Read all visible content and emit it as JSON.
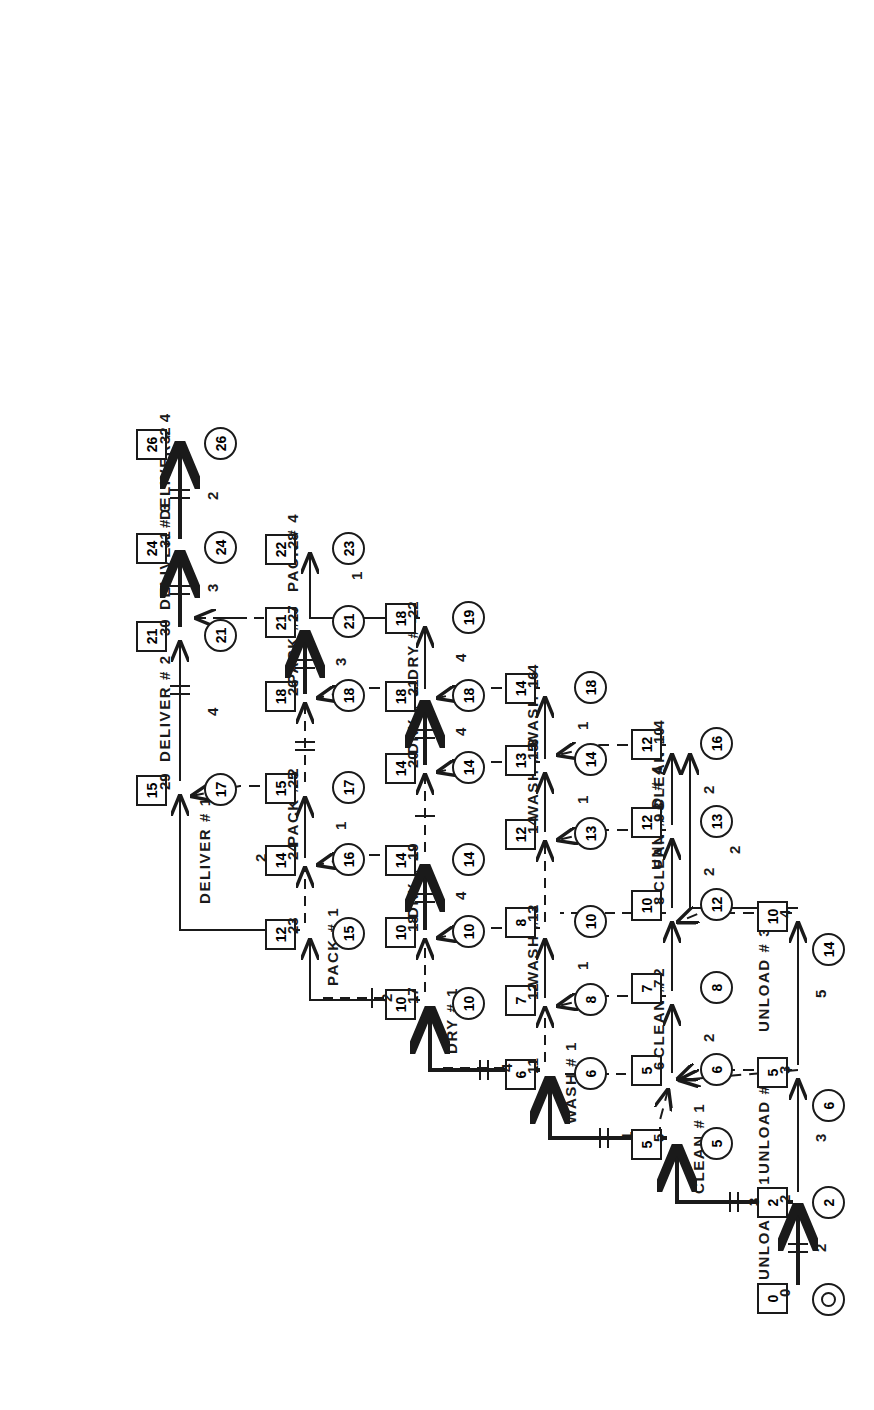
{
  "diagram": {
    "type": "activity-on-arrow network",
    "orientation": "rotated-90",
    "legend": {
      "square_meaning": "earliest event time",
      "circle_meaning": "latest event time",
      "solid_arrow": "real activity",
      "dashed_arrow": "dummy activity",
      "heavy_arrow": "critical path"
    },
    "colors": {
      "ink": "#1a1a1a",
      "paper": "#ffffff"
    },
    "nodes": [
      {
        "id": "0",
        "es": "0",
        "lf": "0"
      },
      {
        "id": "2",
        "es": "2",
        "lf": "2"
      },
      {
        "id": "3",
        "es": "5",
        "lf": "6"
      },
      {
        "id": "4",
        "es": "10",
        "lf": "14"
      },
      {
        "id": "5",
        "es": "5",
        "lf": "5"
      },
      {
        "id": "6",
        "es": "5",
        "lf": "6"
      },
      {
        "id": "7",
        "es": "7",
        "lf": "8"
      },
      {
        "id": "8",
        "es": "10",
        "lf": "12"
      },
      {
        "id": "9",
        "es": "12",
        "lf": "13"
      },
      {
        "id": "10",
        "es": "12",
        "lf": "16"
      },
      {
        "id": "11",
        "es": "6",
        "lf": "6"
      },
      {
        "id": "12",
        "es": "7",
        "lf": "8"
      },
      {
        "id": "13",
        "es": "8",
        "lf": "10"
      },
      {
        "id": "14",
        "es": "12",
        "lf": "13"
      },
      {
        "id": "15",
        "es": "13",
        "lf": "14"
      },
      {
        "id": "16",
        "es": "14",
        "lf": "18"
      },
      {
        "id": "17",
        "es": "10",
        "lf": "10"
      },
      {
        "id": "18",
        "es": "10",
        "lf": "10"
      },
      {
        "id": "19",
        "es": "14",
        "lf": "14"
      },
      {
        "id": "20",
        "es": "14",
        "lf": "14"
      },
      {
        "id": "21",
        "es": "18",
        "lf": "18"
      },
      {
        "id": "22",
        "es": "18",
        "lf": "19"
      },
      {
        "id": "23",
        "es": "12",
        "lf": "15"
      },
      {
        "id": "24",
        "es": "14",
        "lf": "16"
      },
      {
        "id": "25",
        "es": "15",
        "lf": "17"
      },
      {
        "id": "26",
        "es": "18",
        "lf": "18"
      },
      {
        "id": "27",
        "es": "21",
        "lf": "21"
      },
      {
        "id": "28",
        "es": "22",
        "lf": "23"
      },
      {
        "id": "29",
        "es": "15",
        "lf": "17"
      },
      {
        "id": "30",
        "es": "21",
        "lf": "21"
      },
      {
        "id": "31",
        "es": "24",
        "lf": "24"
      },
      {
        "id": "32",
        "es": "26",
        "lf": "26"
      }
    ],
    "activities": [
      {
        "name": "UNLOAD # 1",
        "duration": "2",
        "from": "0",
        "to": "2",
        "critical": true
      },
      {
        "name": "UNLOAD # 2",
        "duration": "3",
        "from": "2",
        "to": "3",
        "critical": false
      },
      {
        "name": "UNLOAD # 3",
        "duration": "5",
        "from": "3",
        "to": "4",
        "critical": false
      },
      {
        "name": "UNLOAD # 4",
        "duration": "2",
        "from": "4",
        "to": "10",
        "critical": false
      },
      {
        "name": "CLEAN # 1",
        "duration": "3",
        "from": "2",
        "to": "5",
        "critical": true
      },
      {
        "name": "CLEAN # 2",
        "duration": "2",
        "from": "6",
        "to": "7",
        "critical": false
      },
      {
        "name": "CLEAN # 3",
        "duration": "2",
        "from": "8",
        "to": "9",
        "critical": false
      },
      {
        "name": "CLEAN # 4",
        "duration": "2",
        "from": "9",
        "to": "10",
        "critical": false
      },
      {
        "name": "WASH # 1",
        "duration": "1",
        "from": "5",
        "to": "11",
        "critical": true
      },
      {
        "name": "WASH # 2",
        "duration": "1",
        "from": "12",
        "to": "13",
        "critical": false
      },
      {
        "name": "WASH # 3",
        "duration": "1",
        "from": "14",
        "to": "15",
        "critical": false
      },
      {
        "name": "WASH # 4",
        "duration": "1",
        "from": "15",
        "to": "16",
        "critical": false
      },
      {
        "name": "DRY # 1",
        "duration": "4",
        "from": "11",
        "to": "17",
        "critical": true
      },
      {
        "name": "DRY # 2",
        "duration": "4",
        "from": "18",
        "to": "19",
        "critical": true
      },
      {
        "name": "DRY # 3",
        "duration": "4",
        "from": "20",
        "to": "21",
        "critical": true
      },
      {
        "name": "DRY # 4",
        "duration": "4",
        "from": "21",
        "to": "22",
        "critical": false
      },
      {
        "name": "PACK # 1",
        "duration": "2",
        "from": "17",
        "to": "23",
        "critical": false
      },
      {
        "name": "PACK # 2",
        "duration": "1",
        "from": "24",
        "to": "25",
        "critical": false
      },
      {
        "name": "PACK # 3",
        "duration": "3",
        "from": "26",
        "to": "27",
        "critical": true
      },
      {
        "name": "PACK # 4",
        "duration": "1",
        "from": "22",
        "to": "28",
        "critical": false
      },
      {
        "name": "DELIVER # 1",
        "duration": "2",
        "from": "23",
        "to": "29",
        "critical": false
      },
      {
        "name": "DELIVER # 2",
        "duration": "4",
        "from": "29",
        "to": "30",
        "critical": false
      },
      {
        "name": "DELIVER # 3",
        "duration": "3",
        "from": "30",
        "to": "31",
        "critical": true
      },
      {
        "name": "DELIVER # 4",
        "duration": "2",
        "from": "31",
        "to": "32",
        "critical": true
      }
    ],
    "dummies": [
      {
        "from": "3",
        "to": "6"
      },
      {
        "from": "4",
        "to": "8"
      },
      {
        "from": "5",
        "to": "6"
      },
      {
        "from": "6",
        "to": "8"
      },
      {
        "from": "7",
        "to": "12"
      },
      {
        "from": "8",
        "to": "10"
      },
      {
        "from": "9",
        "to": "14"
      },
      {
        "from": "10",
        "to": "16"
      },
      {
        "from": "11",
        "to": "12"
      },
      {
        "from": "13",
        "to": "14"
      },
      {
        "from": "13",
        "to": "18"
      },
      {
        "from": "15",
        "to": "20"
      },
      {
        "from": "16",
        "to": "22"
      },
      {
        "from": "17",
        "to": "18"
      },
      {
        "from": "19",
        "to": "20"
      },
      {
        "from": "19",
        "to": "24"
      },
      {
        "from": "21",
        "to": "26"
      },
      {
        "from": "23",
        "to": "24"
      },
      {
        "from": "25",
        "to": "26"
      },
      {
        "from": "25",
        "to": "29"
      },
      {
        "from": "26",
        "to": "28"
      },
      {
        "from": "27",
        "to": "30"
      }
    ],
    "node_labels": {
      "n0": "0",
      "n2": "2",
      "n3": "3",
      "n4": "4",
      "n5": "5",
      "n6": "6",
      "n7": "7",
      "n8": "8",
      "n9": "9",
      "n10": "10",
      "n11": "11",
      "n12": "12",
      "n13": "13",
      "n14": "14",
      "n15": "15",
      "n16": "16",
      "n17": "17",
      "n18": "18",
      "n19": "19",
      "n20": "20",
      "n21": "21",
      "n22": "22",
      "n23": "23",
      "n24": "24",
      "n25": "25",
      "n26": "26",
      "n27": "27",
      "n28": "28",
      "n29": "29",
      "n30": "30",
      "n31": "31",
      "n32": "32"
    },
    "es_labels": {
      "e0": "0",
      "e2": "2",
      "e3": "5",
      "e4": "10",
      "e5": "5",
      "e6": "5",
      "e7": "7",
      "e8": "10",
      "e9": "12",
      "e10": "12",
      "e11": "6",
      "e12": "7",
      "e13": "8",
      "e14": "12",
      "e15": "13",
      "e16": "14",
      "e17": "10",
      "e18": "10",
      "e19": "14",
      "e20": "14",
      "e21": "18",
      "e22": "18",
      "e23": "12",
      "e24": "14",
      "e25": "15",
      "e26": "18",
      "e27": "21",
      "e28": "22",
      "e29": "15",
      "e30": "21",
      "e31": "24",
      "e32": "26"
    },
    "lf_labels": {
      "l0": "0",
      "l2": "2",
      "l3": "6",
      "l4": "14",
      "l5": "5",
      "l6": "6",
      "l7": "8",
      "l8": "12",
      "l9": "13",
      "l10": "16",
      "l11": "6",
      "l12": "8",
      "l13": "10",
      "l14": "13",
      "l15": "14",
      "l16": "18",
      "l17": "10",
      "l18": "10",
      "l19": "14",
      "l20": "14",
      "l21": "18",
      "l22": "19",
      "l23": "15",
      "l24": "16",
      "l25": "17",
      "l26": "18",
      "l27": "21",
      "l28": "23",
      "l29": "17",
      "l30": "21",
      "l31": "24",
      "l32": "26"
    },
    "act_labels": {
      "unload1": "UNLOAD # 1",
      "unload2": "UNLOAD # 2",
      "unload3": "UNLOAD # 3",
      "unload4": "UNLOAD # 4",
      "clean1": "CLEAN # 1",
      "clean2": "CLEAN # 2",
      "clean3": "CLEAN # 3",
      "clean4": "CLEAN # 4",
      "wash1": "WASH # 1",
      "wash2": "WASH # 2",
      "wash3": "WASH # 3",
      "wash4": "WASH # 4",
      "dry1": "DRY # 1",
      "dry2": "DRY # 2",
      "dry3": "DRY # 3",
      "dry4": "DRY # 4",
      "pack1": "PACK # 1",
      "pack2": "PACK # 2",
      "pack3": "PACK # 3",
      "pack4": "PACK # 4",
      "deliver1": "DELIVER # 1",
      "deliver2": "DELIVER # 2",
      "deliver3": "DELIVER # 3",
      "deliver4": "DELIVER # 4"
    },
    "dur_labels": {
      "d_unload1": "2",
      "d_unload2": "3",
      "d_unload3": "5",
      "d_unload4": "2",
      "d_clean1": "3",
      "d_clean2": "2",
      "d_clean3": "2",
      "d_clean4": "2",
      "d_wash1": "1",
      "d_wash2": "1",
      "d_wash3": "1",
      "d_wash4": "1",
      "d_dry1": "4",
      "d_dry2": "4",
      "d_dry3": "4",
      "d_dry4": "4",
      "d_pack1": "2",
      "d_pack2": "1",
      "d_pack3": "3",
      "d_pack4": "1",
      "d_deliver1": "2",
      "d_deliver2": "4",
      "d_deliver3": "3",
      "d_deliver4": "2"
    }
  }
}
